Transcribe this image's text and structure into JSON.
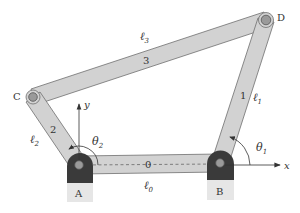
{
  "diagram": {
    "colors": {
      "link_fill": "#d2d2d2",
      "link_stroke": "#6e6e6e",
      "ground_dark": "#3a3a3a",
      "ground_light": "#e6e6e6",
      "pin_fill": "#9a9a9a",
      "text": "#333333"
    },
    "joints": {
      "A": {
        "label": "A",
        "x": 79,
        "y": 165
      },
      "B": {
        "label": "B",
        "x": 220,
        "y": 163
      },
      "C": {
        "label": "C",
        "x": 33,
        "y": 97
      },
      "D": {
        "label": "D",
        "x": 266,
        "y": 20
      }
    },
    "links": [
      {
        "id": "0",
        "number": "0",
        "length_label": "ℓ",
        "length_sub": "0",
        "from": "A",
        "to": "B",
        "dashed": true
      },
      {
        "id": "1",
        "number": "1",
        "length_label": "ℓ",
        "length_sub": "1",
        "from": "B",
        "to": "D"
      },
      {
        "id": "2",
        "number": "2",
        "length_label": "ℓ",
        "length_sub": "2",
        "from": "A",
        "to": "C"
      },
      {
        "id": "3",
        "number": "3",
        "length_label": "ℓ",
        "length_sub": "3",
        "from": "C",
        "to": "D"
      }
    ],
    "axes": {
      "x_label": "x",
      "y_label": "y"
    },
    "angles": [
      {
        "symbol": "θ",
        "sub": "2",
        "at": "A"
      },
      {
        "symbol": "θ",
        "sub": "1",
        "at": "B"
      }
    ]
  }
}
